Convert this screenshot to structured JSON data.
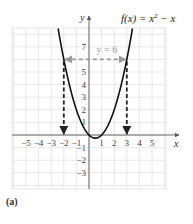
{
  "chart_data": {
    "type": "line",
    "title": "",
    "function_label": "f(x) = x² − x",
    "function_label_parts": {
      "lhs": "f(x) = x",
      "exp": "2",
      "rhs": " − x"
    },
    "xlabel": "x",
    "ylabel": "y",
    "xlim": [
      -6,
      6.5
    ],
    "ylim": [
      -4.3,
      8.5
    ],
    "grid": true,
    "x_ticks": [
      -5,
      -4,
      -3,
      -2,
      -1,
      1,
      2,
      3,
      4,
      5
    ],
    "y_ticks": [
      -3,
      -2,
      -1,
      1,
      2,
      3,
      4,
      5,
      7
    ],
    "series": [
      {
        "name": "f(x) = x^2 - x",
        "style": "solid",
        "color": "#111111",
        "x": [
          -2.4,
          -2,
          -1.5,
          -1,
          -0.5,
          0,
          0.5,
          1,
          1.5,
          2,
          2.5,
          3,
          3.4
        ],
        "values": [
          8.16,
          6,
          3.75,
          2,
          0.75,
          0,
          -0.25,
          0,
          0.75,
          2,
          3.75,
          6,
          8.16
        ]
      },
      {
        "name": "y = 6",
        "style": "dashed-double-arrow",
        "color": "#9a9a9a",
        "x": [
          -2,
          3
        ],
        "values": [
          6,
          6
        ]
      }
    ],
    "annotations": [
      {
        "text": "y = 6",
        "x": 0.6,
        "y": 6.6,
        "color": "#9a9a9a"
      },
      {
        "type": "dashed-arrow-down",
        "x": -2,
        "from_y": 6,
        "to_y": 0,
        "color": "#222222"
      },
      {
        "type": "dashed-arrow-down",
        "x": 3,
        "from_y": 6,
        "to_y": 0,
        "color": "#222222"
      }
    ],
    "panel_label": "(a)"
  },
  "colors": {
    "grid": "#e2e2e2",
    "axis": "#555555",
    "curve": "#111111",
    "hline": "#9a9a9a",
    "vline": "#222222"
  }
}
